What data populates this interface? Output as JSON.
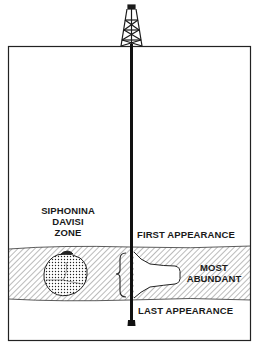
{
  "diagram": {
    "zone_label": [
      "SIPHONINA",
      "DAVISI",
      "ZONE"
    ],
    "labels": {
      "first_appearance": "FIRST APPEARANCE",
      "most_abundant": [
        "MOST",
        "ABUNDANT"
      ],
      "last_appearance": "LAST APPEARANCE"
    },
    "icons": [
      "drilling-rig-icon",
      "foraminifera-fossil-icon",
      "abundance-curve",
      "range-bracket"
    ],
    "colors": {
      "ink": "#1a1a1a",
      "background": "#ffffff"
    }
  }
}
